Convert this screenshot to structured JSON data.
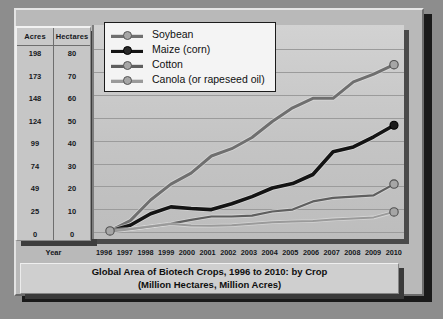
{
  "chart_data": {
    "type": "line",
    "title": "Global Area of Biotech Crops, 1996 to 2010: by Crop",
    "subtitle": "(Million Hectares, Million Acres)",
    "xlabel": "Year",
    "ylabel": "",
    "grid": true,
    "legend_position": "top-left",
    "x": [
      1996,
      1997,
      1998,
      1999,
      2000,
      2001,
      2002,
      2003,
      2004,
      2005,
      2006,
      2007,
      2008,
      2009,
      2010
    ],
    "categories": [
      "1996",
      "1997",
      "1998",
      "1999",
      "2000",
      "2001",
      "2002",
      "2003",
      "2004",
      "2005",
      "2006",
      "2007",
      "2008",
      "2009",
      "2010"
    ],
    "ylim": [
      0,
      85
    ],
    "yticks_hectares": [
      0,
      10,
      20,
      30,
      40,
      50,
      60,
      70,
      80
    ],
    "yticks_acres": [
      0,
      25,
      49,
      74,
      99,
      124,
      148,
      173,
      198
    ],
    "axis_headers": {
      "acres": "Acres",
      "hectares": "Hectares"
    },
    "series": [
      {
        "name": "Soybean",
        "color": "#6f6f6f",
        "values": [
          0.5,
          5,
          14,
          21,
          25.8,
          33.3,
          36.5,
          41.4,
          48.4,
          54.4,
          58.6,
          58.6,
          65.8,
          69.2,
          73.3
        ]
      },
      {
        "name": "Maize (corn)",
        "color": "#141414",
        "values": [
          0.3,
          3,
          8,
          11,
          10.3,
          9.8,
          12.4,
          15.5,
          19.3,
          21.2,
          25.2,
          35.2,
          37.3,
          41.7,
          46.8
        ]
      },
      {
        "name": "Cotton",
        "color": "#5f5f5f",
        "values": [
          0.8,
          1.4,
          2.5,
          3.7,
          5.3,
          6.8,
          6.8,
          7.2,
          9,
          9.8,
          13.4,
          15,
          15.5,
          16.1,
          21
        ]
      },
      {
        "name": "Canola (or rapeseed oil)",
        "color": "#9a9a9a",
        "values": [
          0.1,
          1.2,
          2.4,
          3.5,
          2.8,
          2.7,
          3,
          3.6,
          4.3,
          4.6,
          4.8,
          5.5,
          5.9,
          6.4,
          8.8
        ]
      }
    ]
  },
  "legend": {
    "items": [
      {
        "label": "Soybean"
      },
      {
        "label": "Maize (corn)"
      },
      {
        "label": "Cotton"
      },
      {
        "label": "Canola (or rapeseed oil)"
      }
    ]
  },
  "table": {
    "headers": {
      "acres": "Acres",
      "hectares": "Hectares"
    },
    "acres": [
      "198",
      "173",
      "148",
      "124",
      "99",
      "74",
      "49",
      "25",
      "0"
    ],
    "hectares": [
      "80",
      "70",
      "60",
      "50",
      "40",
      "30",
      "20",
      "10",
      "0"
    ]
  },
  "xaxis": {
    "label": "Year",
    "years": [
      "1996",
      "1997",
      "1998",
      "1999",
      "2000",
      "2001",
      "2002",
      "2003",
      "2004",
      "2005",
      "2006",
      "2007",
      "2008",
      "2009",
      "2010"
    ]
  },
  "footer": {
    "line1": "Global Area of Biotech Crops, 1996 to 2010: by Crop",
    "line2": "(Million Hectares, Million Acres)"
  },
  "colors": {
    "soybean": "#6f6f6f",
    "maize": "#141414",
    "cotton": "#5f5f5f",
    "canola": "#9a9a9a",
    "background": "#8d8d8d",
    "panel": "#b9b9b9",
    "plot": "#c8c8c8"
  }
}
